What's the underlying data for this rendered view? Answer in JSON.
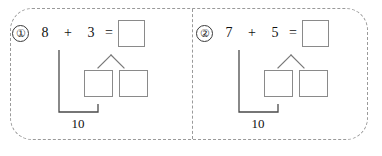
{
  "worksheet": {
    "title": "Number bond addition worksheet",
    "frame_style": "dashed-rounded",
    "divider_style": "dashed-vertical",
    "colors": {
      "text": "#101010",
      "box_border": "#8a8a8a",
      "frame_border": "#9a9a9a",
      "bracket_line": "#4a4a4a",
      "branch_line": "#787878",
      "background": "#ffffff"
    }
  },
  "problems": [
    {
      "marker": "①",
      "marker_name": "circled-one",
      "addend1": "8",
      "plus": "+",
      "addend2": "3",
      "equals": "=",
      "result": "",
      "decomp_left": "",
      "decomp_right": "",
      "total": "10"
    },
    {
      "marker": "②",
      "marker_name": "circled-two",
      "addend1": "7",
      "plus": "+",
      "addend2": "5",
      "equals": "=",
      "result": "",
      "decomp_left": "",
      "decomp_right": "",
      "total": "10"
    }
  ]
}
